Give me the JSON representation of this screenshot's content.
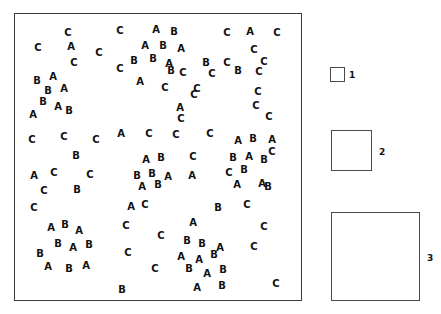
{
  "figure": {
    "plot": {
      "frame": {
        "x": 14,
        "y": 13,
        "width": 288,
        "height": 288
      },
      "point_labels": [
        "A",
        "B",
        "C"
      ],
      "points": [
        {
          "label": "C",
          "x": 67,
          "y": 32
        },
        {
          "label": "C",
          "x": 119,
          "y": 30
        },
        {
          "label": "A",
          "x": 155,
          "y": 29
        },
        {
          "label": "B",
          "x": 173,
          "y": 31
        },
        {
          "label": "C",
          "x": 226,
          "y": 32
        },
        {
          "label": "A",
          "x": 249,
          "y": 31
        },
        {
          "label": "C",
          "x": 276,
          "y": 32
        },
        {
          "label": "C",
          "x": 37,
          "y": 47
        },
        {
          "label": "A",
          "x": 70,
          "y": 46
        },
        {
          "label": "C",
          "x": 98,
          "y": 52
        },
        {
          "label": "A",
          "x": 144,
          "y": 45
        },
        {
          "label": "B",
          "x": 162,
          "y": 45
        },
        {
          "label": "A",
          "x": 180,
          "y": 48
        },
        {
          "label": "C",
          "x": 253,
          "y": 49
        },
        {
          "label": "C",
          "x": 73,
          "y": 62
        },
        {
          "label": "B",
          "x": 133,
          "y": 60
        },
        {
          "label": "B",
          "x": 152,
          "y": 58
        },
        {
          "label": "A",
          "x": 168,
          "y": 63
        },
        {
          "label": "B",
          "x": 205,
          "y": 62
        },
        {
          "label": "C",
          "x": 226,
          "y": 62
        },
        {
          "label": "C",
          "x": 263,
          "y": 61
        },
        {
          "label": "B",
          "x": 36,
          "y": 80
        },
        {
          "label": "A",
          "x": 52,
          "y": 76
        },
        {
          "label": "C",
          "x": 119,
          "y": 68
        },
        {
          "label": "B",
          "x": 170,
          "y": 70
        },
        {
          "label": "C",
          "x": 182,
          "y": 72
        },
        {
          "label": "C",
          "x": 211,
          "y": 73
        },
        {
          "label": "B",
          "x": 237,
          "y": 70
        },
        {
          "label": "C",
          "x": 258,
          "y": 71
        },
        {
          "label": "B",
          "x": 47,
          "y": 90
        },
        {
          "label": "A",
          "x": 63,
          "y": 88
        },
        {
          "label": "A",
          "x": 139,
          "y": 81
        },
        {
          "label": "C",
          "x": 164,
          "y": 87
        },
        {
          "label": "C",
          "x": 196,
          "y": 88
        },
        {
          "label": "B",
          "x": 42,
          "y": 101
        },
        {
          "label": "C",
          "x": 193,
          "y": 94
        },
        {
          "label": "C",
          "x": 257,
          "y": 91
        },
        {
          "label": "A",
          "x": 57,
          "y": 106
        },
        {
          "label": "B",
          "x": 68,
          "y": 110
        },
        {
          "label": "A",
          "x": 179,
          "y": 107
        },
        {
          "label": "C",
          "x": 255,
          "y": 105
        },
        {
          "label": "A",
          "x": 32,
          "y": 114
        },
        {
          "label": "C",
          "x": 180,
          "y": 118
        },
        {
          "label": "C",
          "x": 268,
          "y": 116
        },
        {
          "label": "C",
          "x": 31,
          "y": 139
        },
        {
          "label": "C",
          "x": 63,
          "y": 136
        },
        {
          "label": "C",
          "x": 95,
          "y": 139
        },
        {
          "label": "A",
          "x": 120,
          "y": 133
        },
        {
          "label": "C",
          "x": 148,
          "y": 133
        },
        {
          "label": "C",
          "x": 175,
          "y": 134
        },
        {
          "label": "C",
          "x": 209,
          "y": 133
        },
        {
          "label": "A",
          "x": 237,
          "y": 140
        },
        {
          "label": "B",
          "x": 252,
          "y": 138
        },
        {
          "label": "A",
          "x": 271,
          "y": 139
        },
        {
          "label": "B",
          "x": 75,
          "y": 155
        },
        {
          "label": "C",
          "x": 271,
          "y": 151
        },
        {
          "label": "A",
          "x": 145,
          "y": 159
        },
        {
          "label": "B",
          "x": 160,
          "y": 157
        },
        {
          "label": "C",
          "x": 192,
          "y": 156
        },
        {
          "label": "B",
          "x": 232,
          "y": 157
        },
        {
          "label": "A",
          "x": 248,
          "y": 156
        },
        {
          "label": "B",
          "x": 263,
          "y": 159
        },
        {
          "label": "A",
          "x": 33,
          "y": 175
        },
        {
          "label": "C",
          "x": 53,
          "y": 172
        },
        {
          "label": "C",
          "x": 89,
          "y": 174
        },
        {
          "label": "B",
          "x": 136,
          "y": 175
        },
        {
          "label": "B",
          "x": 151,
          "y": 173
        },
        {
          "label": "A",
          "x": 167,
          "y": 176
        },
        {
          "label": "A",
          "x": 191,
          "y": 175
        },
        {
          "label": "C",
          "x": 228,
          "y": 172
        },
        {
          "label": "B",
          "x": 243,
          "y": 169
        },
        {
          "label": "C",
          "x": 43,
          "y": 190
        },
        {
          "label": "B",
          "x": 76,
          "y": 189
        },
        {
          "label": "A",
          "x": 141,
          "y": 186
        },
        {
          "label": "B",
          "x": 157,
          "y": 184
        },
        {
          "label": "A",
          "x": 236,
          "y": 184
        },
        {
          "label": "A",
          "x": 261,
          "y": 183
        },
        {
          "label": "B",
          "x": 267,
          "y": 186
        },
        {
          "label": "C",
          "x": 33,
          "y": 207
        },
        {
          "label": "A",
          "x": 130,
          "y": 206
        },
        {
          "label": "C",
          "x": 144,
          "y": 204
        },
        {
          "label": "B",
          "x": 217,
          "y": 207
        },
        {
          "label": "C",
          "x": 246,
          "y": 204
        },
        {
          "label": "A",
          "x": 50,
          "y": 227
        },
        {
          "label": "B",
          "x": 64,
          "y": 224
        },
        {
          "label": "A",
          "x": 78,
          "y": 230
        },
        {
          "label": "C",
          "x": 125,
          "y": 225
        },
        {
          "label": "A",
          "x": 192,
          "y": 222
        },
        {
          "label": "C",
          "x": 160,
          "y": 235
        },
        {
          "label": "C",
          "x": 263,
          "y": 226
        },
        {
          "label": "B",
          "x": 57,
          "y": 243
        },
        {
          "label": "A",
          "x": 72,
          "y": 247
        },
        {
          "label": "B",
          "x": 88,
          "y": 244
        },
        {
          "label": "B",
          "x": 186,
          "y": 240
        },
        {
          "label": "B",
          "x": 201,
          "y": 243
        },
        {
          "label": "A",
          "x": 219,
          "y": 247
        },
        {
          "label": "C",
          "x": 253,
          "y": 246
        },
        {
          "label": "B",
          "x": 39,
          "y": 253
        },
        {
          "label": "C",
          "x": 127,
          "y": 252
        },
        {
          "label": "A",
          "x": 180,
          "y": 256
        },
        {
          "label": "A",
          "x": 198,
          "y": 259
        },
        {
          "label": "B",
          "x": 213,
          "y": 254
        },
        {
          "label": "A",
          "x": 47,
          "y": 266
        },
        {
          "label": "B",
          "x": 68,
          "y": 268
        },
        {
          "label": "A",
          "x": 85,
          "y": 265
        },
        {
          "label": "C",
          "x": 154,
          "y": 268
        },
        {
          "label": "B",
          "x": 188,
          "y": 268
        },
        {
          "label": "A",
          "x": 206,
          "y": 273
        },
        {
          "label": "B",
          "x": 222,
          "y": 269
        },
        {
          "label": "B",
          "x": 121,
          "y": 289
        },
        {
          "label": "A",
          "x": 196,
          "y": 287
        },
        {
          "label": "B",
          "x": 221,
          "y": 285
        },
        {
          "label": "C",
          "x": 275,
          "y": 283
        }
      ]
    },
    "quadrats": [
      {
        "label": "1",
        "x": 330,
        "y": 67,
        "size": 15,
        "label_x": 349,
        "label_y": 75
      },
      {
        "label": "2",
        "x": 331,
        "y": 130,
        "size": 41,
        "label_x": 379,
        "label_y": 152
      },
      {
        "label": "3",
        "x": 331,
        "y": 212,
        "size": 89,
        "label_x": 427,
        "label_y": 258
      }
    ]
  }
}
